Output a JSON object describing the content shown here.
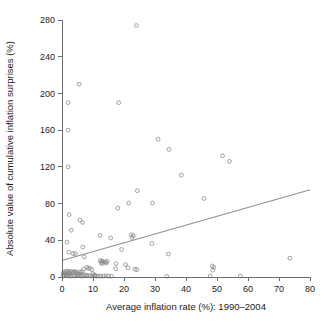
{
  "chart_data": {
    "type": "scatter",
    "title": "",
    "xlabel": "Average inflation rate (%): 1990–2004",
    "ylabel": "Absolute value of cumulative inflation surprises (%)",
    "xlim": [
      0,
      80
    ],
    "ylim": [
      0,
      280
    ],
    "xticks": [
      0,
      10,
      20,
      30,
      40,
      50,
      60,
      70,
      80
    ],
    "yticks": [
      0,
      40,
      80,
      120,
      160,
      200,
      240,
      280
    ],
    "xtick_labels": [
      "0",
      "10",
      "20",
      "30",
      "40",
      "50",
      "60",
      "70",
      "80"
    ],
    "ytick_labels": [
      "0",
      "40",
      "80",
      "120",
      "160",
      "200",
      "240",
      "280"
    ],
    "grid": false,
    "legend": null,
    "marker": "open-circle",
    "marker_color": "#8a8a8a",
    "series": [
      {
        "name": "Countries",
        "points": [
          [
            24.0,
            274.0
          ],
          [
            5.5,
            210.0
          ],
          [
            2.0,
            190.0
          ],
          [
            18.3,
            190.0
          ],
          [
            2.0,
            160.0
          ],
          [
            31.0,
            150.0
          ],
          [
            34.5,
            139.0
          ],
          [
            51.8,
            132.0
          ],
          [
            54.0,
            126.0
          ],
          [
            2.0,
            120.0
          ],
          [
            38.5,
            111.0
          ],
          [
            24.3,
            94.0
          ],
          [
            45.8,
            85.5
          ],
          [
            21.5,
            80.5
          ],
          [
            29.2,
            80.5
          ],
          [
            18.0,
            75.0
          ],
          [
            2.3,
            68.0
          ],
          [
            5.8,
            62.0
          ],
          [
            6.6,
            59.5
          ],
          [
            3.0,
            51.0
          ],
          [
            12.3,
            45.5
          ],
          [
            15.7,
            42.5
          ],
          [
            22.3,
            46.0
          ],
          [
            23.0,
            45.0
          ],
          [
            22.6,
            43.0
          ],
          [
            1.6,
            38.0
          ],
          [
            6.7,
            32.5
          ],
          [
            29.0,
            36.5
          ],
          [
            19.2,
            30.0
          ],
          [
            2.2,
            27.0
          ],
          [
            3.6,
            25.5
          ],
          [
            4.3,
            25.5
          ],
          [
            34.3,
            25.0
          ],
          [
            7.2,
            22.0
          ],
          [
            12.3,
            18.0
          ],
          [
            12.8,
            17.5
          ],
          [
            13.1,
            16.8
          ],
          [
            13.5,
            16.2
          ],
          [
            14.0,
            16.5
          ],
          [
            14.6,
            17.0
          ],
          [
            14.3,
            15.2
          ],
          [
            13.0,
            14.6
          ],
          [
            12.6,
            15.5
          ],
          [
            73.5,
            20.5
          ],
          [
            17.4,
            14.5
          ],
          [
            20.5,
            13.5
          ],
          [
            21.3,
            10.0
          ],
          [
            23.5,
            8.5
          ],
          [
            24.2,
            8.0
          ],
          [
            17.3,
            9.0
          ],
          [
            48.5,
            12.0
          ],
          [
            49.0,
            10.5
          ],
          [
            48.6,
            7.5
          ],
          [
            8.0,
            10.5
          ],
          [
            8.5,
            9.5
          ],
          [
            9.0,
            9.5
          ],
          [
            9.6,
            8.0
          ],
          [
            7.0,
            8.5
          ],
          [
            6.5,
            6.0
          ],
          [
            5.8,
            5.5
          ],
          [
            5.0,
            5.0
          ],
          [
            4.4,
            4.5
          ],
          [
            3.8,
            5.2
          ],
          [
            3.2,
            4.2
          ],
          [
            2.6,
            3.5
          ],
          [
            2.0,
            4.0
          ],
          [
            1.5,
            3.0
          ],
          [
            1.0,
            3.5
          ],
          [
            0.6,
            3.0
          ],
          [
            0.4,
            4.5
          ],
          [
            0.9,
            5.5
          ],
          [
            1.3,
            6.0
          ],
          [
            1.8,
            6.5
          ],
          [
            2.4,
            5.5
          ],
          [
            3.0,
            6.2
          ],
          [
            3.6,
            5.0
          ],
          [
            4.2,
            6.0
          ],
          [
            4.9,
            3.0
          ],
          [
            5.5,
            2.5
          ],
          [
            6.1,
            3.2
          ],
          [
            6.8,
            2.0
          ],
          [
            7.5,
            2.4
          ],
          [
            8.2,
            1.8
          ],
          [
            8.9,
            1.5
          ],
          [
            9.7,
            1.2
          ],
          [
            10.4,
            1.5
          ],
          [
            11.1,
            1.0
          ],
          [
            11.8,
            1.2
          ],
          [
            12.5,
            0.9
          ],
          [
            13.4,
            1.0
          ],
          [
            14.2,
            1.4
          ],
          [
            0.3,
            1.0
          ],
          [
            0.7,
            1.5
          ],
          [
            1.2,
            2.0
          ],
          [
            1.7,
            1.2
          ],
          [
            2.2,
            1.8
          ],
          [
            2.8,
            1.0
          ],
          [
            3.4,
            1.6
          ],
          [
            4.0,
            1.1
          ],
          [
            4.6,
            2.2
          ],
          [
            5.2,
            1.3
          ],
          [
            6.3,
            1.0
          ],
          [
            7.9,
            1.5
          ],
          [
            10.0,
            3.5
          ],
          [
            10.6,
            2.0
          ],
          [
            33.8,
            0.8
          ],
          [
            47.8,
            1.2
          ],
          [
            57.5,
            1.0
          ],
          [
            15.0,
            1.0
          ],
          [
            16.0,
            0.8
          ]
        ]
      }
    ],
    "fit_line": {
      "name": "linear fit",
      "x0": 0,
      "y0": 18,
      "x1": 80,
      "y1": 95
    }
  }
}
